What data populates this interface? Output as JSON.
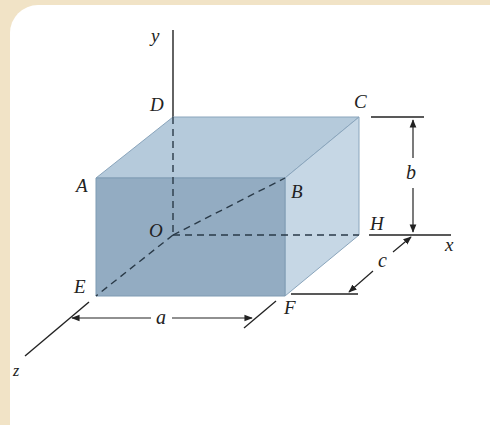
{
  "figure": {
    "type": "rectangular-box-3d",
    "axes": {
      "x": "x",
      "y": "y",
      "z": "z"
    },
    "vertices": {
      "A": "A",
      "B": "B",
      "C": "C",
      "D": "D",
      "E": "E",
      "F": "F",
      "H": "H",
      "O": "O"
    },
    "dimensions": {
      "a": "a",
      "b": "b",
      "c": "c"
    },
    "colors": {
      "background_border": "#f1e3c6",
      "front_face": "#8fa9c0",
      "top_face": "#b5cadb",
      "side_face": "#c4d6e4",
      "edge": "#7f9bb3",
      "line": "#222222"
    }
  }
}
